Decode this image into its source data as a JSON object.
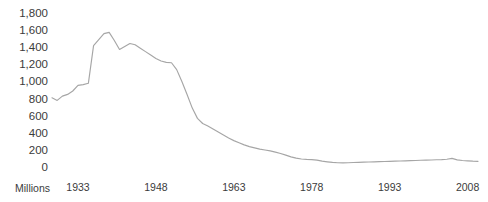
{
  "chart_data": {
    "type": "line",
    "title": "",
    "xlabel": "",
    "ylabel": "Millions",
    "unit_label": "Millions",
    "ylim": [
      0,
      1800
    ],
    "xlim": [
      1928,
      2010
    ],
    "grid": false,
    "legend": false,
    "line_color": "#a6a6a6",
    "text_color": "#3b3b3b",
    "background_color": "#ffffff",
    "y_ticks": [
      "1,800",
      "1,600",
      "1,400",
      "1,200",
      "1,000",
      "800",
      "600",
      "400",
      "200",
      "0"
    ],
    "y_tick_values": [
      1800,
      1600,
      1400,
      1200,
      1000,
      800,
      600,
      400,
      200,
      0
    ],
    "x_ticks": [
      "1933",
      "1948",
      "1963",
      "1978",
      "1993",
      "2008"
    ],
    "x_tick_values": [
      1933,
      1948,
      1963,
      1978,
      1993,
      2008
    ],
    "series": [
      {
        "name": "",
        "x": [
          1928,
          1929,
          1930,
          1931,
          1932,
          1933,
          1934,
          1935,
          1936,
          1937,
          1938,
          1939,
          1940,
          1941,
          1942,
          1943,
          1944,
          1945,
          1946,
          1947,
          1948,
          1949,
          1950,
          1951,
          1952,
          1953,
          1954,
          1955,
          1956,
          1957,
          1958,
          1959,
          1960,
          1961,
          1962,
          1963,
          1964,
          1965,
          1966,
          1967,
          1968,
          1969,
          1970,
          1971,
          1972,
          1973,
          1974,
          1975,
          1976,
          1977,
          1978,
          1979,
          1980,
          1981,
          1982,
          1983,
          1984,
          1985,
          1986,
          1987,
          1988,
          1989,
          1990,
          1991,
          1992,
          1993,
          1994,
          1995,
          1996,
          1997,
          1998,
          1999,
          2000,
          2001,
          2002,
          2003,
          2004,
          2005,
          2006,
          2007,
          2008,
          2009,
          2010
        ],
        "values": [
          820,
          790,
          840,
          860,
          900,
          965,
          975,
          990,
          1430,
          1500,
          1570,
          1585,
          1490,
          1385,
          1420,
          1455,
          1440,
          1400,
          1360,
          1320,
          1280,
          1250,
          1235,
          1230,
          1150,
          1010,
          860,
          700,
          580,
          520,
          490,
          455,
          420,
          385,
          350,
          320,
          295,
          270,
          250,
          235,
          220,
          210,
          200,
          185,
          170,
          150,
          130,
          115,
          105,
          100,
          98,
          92,
          80,
          72,
          65,
          62,
          60,
          62,
          64,
          66,
          68,
          70,
          72,
          74,
          76,
          78,
          80,
          82,
          84,
          86,
          88,
          90,
          92,
          94,
          96,
          98,
          102,
          112,
          95,
          88,
          84,
          80,
          78
        ]
      }
    ]
  }
}
